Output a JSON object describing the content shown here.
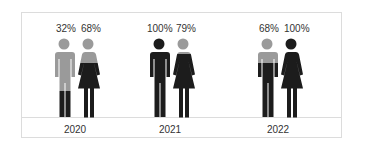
{
  "chart_data": {
    "type": "pictograph",
    "title": "",
    "categories": [
      "2020",
      "2021",
      "2022"
    ],
    "series": [
      {
        "name": "Male",
        "values": [
          32,
          100,
          68
        ]
      },
      {
        "name": "Female",
        "values": [
          68,
          79,
          100
        ]
      }
    ],
    "colors": {
      "filled": "#1c1c1c",
      "empty": "#9a9a9a"
    }
  },
  "labels": {
    "g0": {
      "year": "2020",
      "male": "32%",
      "female": "68%"
    },
    "g1": {
      "year": "2021",
      "male": "100%",
      "female": "79%"
    },
    "g2": {
      "year": "2022",
      "male": "68%",
      "female": "100%"
    }
  }
}
